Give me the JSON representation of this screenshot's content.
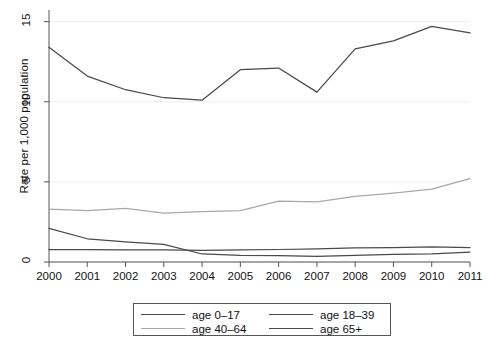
{
  "chart_data": {
    "type": "line",
    "title": "",
    "xlabel": "",
    "ylabel": "Rate per 1,000 population",
    "x": [
      2000,
      2001,
      2002,
      2003,
      2004,
      2005,
      2006,
      2007,
      2008,
      2009,
      2010,
      2011
    ],
    "xtick_labels": [
      "2000",
      "2001",
      "2002",
      "2003",
      "2004",
      "2005",
      "2006",
      "2007",
      "2008",
      "2009",
      "2010",
      "2011"
    ],
    "ytick_labels": [
      "0",
      "5",
      "10",
      "15"
    ],
    "yticks": [
      0,
      5,
      10,
      15
    ],
    "ylim": [
      0,
      15.6
    ],
    "xlim": [
      2000,
      2011
    ],
    "grid": true,
    "grid_axis": "y",
    "legend_position": "below-center",
    "series": [
      {
        "name": "age 0–17",
        "color": "#4a4a4a",
        "values": [
          2.1,
          1.45,
          1.25,
          1.1,
          0.5,
          0.42,
          0.4,
          0.35,
          0.42,
          0.48,
          0.5,
          0.62
        ]
      },
      {
        "name": "age 18–39",
        "color": "#4a4a4a",
        "values": [
          13.4,
          11.6,
          10.75,
          10.25,
          10.1,
          12.0,
          12.1,
          10.6,
          13.3,
          13.8,
          14.7,
          14.3
        ]
      },
      {
        "name": "age 40–64",
        "color": "#a8a8a8",
        "values": [
          3.3,
          3.2,
          3.35,
          3.05,
          3.15,
          3.2,
          3.8,
          3.75,
          4.1,
          4.3,
          4.55,
          5.2
        ]
      },
      {
        "name": "age 65+",
        "color": "#4a4a4a",
        "values": [
          0.78,
          0.77,
          0.76,
          0.75,
          0.72,
          0.75,
          0.78,
          0.82,
          0.88,
          0.9,
          0.95,
          0.9
        ]
      }
    ]
  },
  "axes": {
    "y_title": "Rate per 1,000 population"
  },
  "legend": {
    "entries": [
      {
        "label": "age 0–17",
        "color": "#4a4a4a"
      },
      {
        "label": "age 18–39",
        "color": "#4a4a4a"
      },
      {
        "label": "age 40–64",
        "color": "#a8a8a8"
      },
      {
        "label": "age 65+",
        "color": "#4a4a4a"
      }
    ]
  }
}
